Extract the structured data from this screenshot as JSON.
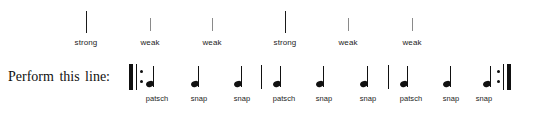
{
  "figure": {
    "prompt": "Perform this line:"
  },
  "accents": {
    "ticks": [
      {
        "label": "strong",
        "strength": "strong",
        "x": 86,
        "tick_top": 11,
        "tick_height": 22,
        "label_y": 38
      },
      {
        "label": "weak",
        "strength": "weak",
        "x": 150,
        "tick_top": 18,
        "tick_height": 13,
        "label_y": 38
      },
      {
        "label": "weak",
        "strength": "weak",
        "x": 212,
        "tick_top": 18,
        "tick_height": 13,
        "label_y": 38
      },
      {
        "label": "strong",
        "strength": "strong",
        "x": 285,
        "tick_top": 11,
        "tick_height": 22,
        "label_y": 38
      },
      {
        "label": "weak",
        "strength": "weak",
        "x": 348,
        "tick_top": 18,
        "tick_height": 13,
        "label_y": 38
      },
      {
        "label": "weak",
        "strength": "weak",
        "x": 412,
        "tick_top": 18,
        "tick_height": 13,
        "label_y": 38
      }
    ]
  },
  "notation": {
    "start_repeat": {
      "name": "start-repeat-sign",
      "thick_x": 129,
      "thin_x": 136,
      "dot_x": 140,
      "top": 64,
      "height": 26,
      "dot_upper_y": 70,
      "dot_lower_y": 80
    },
    "end_repeat": {
      "name": "end-repeat-sign",
      "dot_x": 497,
      "thin_x": 503,
      "thick_x": 507,
      "top": 64,
      "height": 26,
      "dot_upper_y": 70,
      "dot_lower_y": 80
    },
    "measure_barlines": [
      {
        "x": 261,
        "top": 65,
        "height": 24
      },
      {
        "x": 388,
        "top": 65,
        "height": 24
      }
    ],
    "measures": [
      {
        "index": 1,
        "notes": [
          {
            "label": "patsch",
            "x": 146,
            "y": 66,
            "label_x": 157,
            "label_y": 94
          },
          {
            "label": "snap",
            "x": 191,
            "y": 66,
            "label_x": 199,
            "label_y": 94
          },
          {
            "label": "snap",
            "x": 234,
            "y": 66,
            "label_x": 242,
            "label_y": 94
          }
        ]
      },
      {
        "index": 2,
        "notes": [
          {
            "label": "patsch",
            "x": 273,
            "y": 66,
            "label_x": 284,
            "label_y": 94
          },
          {
            "label": "snap",
            "x": 316,
            "y": 66,
            "label_x": 324,
            "label_y": 94
          },
          {
            "label": "snap",
            "x": 360,
            "y": 66,
            "label_x": 368,
            "label_y": 94
          }
        ]
      },
      {
        "index": 3,
        "notes": [
          {
            "label": "patsch",
            "x": 400,
            "y": 66,
            "label_x": 411,
            "label_y": 94
          },
          {
            "label": "snap",
            "x": 443,
            "y": 66,
            "label_x": 451,
            "label_y": 94
          },
          {
            "label": "snap",
            "x": 483,
            "y": 66,
            "label_x": 484,
            "label_y": 94
          }
        ]
      }
    ]
  },
  "colors": {
    "ink": "#111111",
    "weak_tick": "#8a8a8a",
    "background": "#ffffff"
  }
}
